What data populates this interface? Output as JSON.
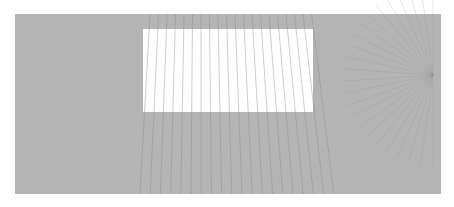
{
  "artwork": {
    "background_color": "#ffffff",
    "field": {
      "x": 15,
      "y": 14,
      "w": 426,
      "h": 180,
      "color": "#b4b4b4"
    },
    "window_rect": {
      "x": 143,
      "y": 29,
      "w": 170,
      "h": 83,
      "color": "#ffffff"
    },
    "line_color": "#8a8a8a",
    "radial_focus": {
      "x": 433,
      "y": 75
    }
  }
}
